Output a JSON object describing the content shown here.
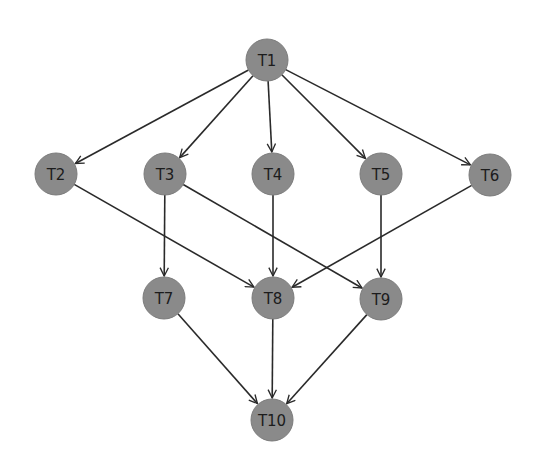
{
  "diagram": {
    "type": "directed-acyclic-graph",
    "node_color": "#8a8a8a",
    "edge_color": "#2a2a2a",
    "node_radius": 21,
    "nodes": [
      {
        "id": "T1",
        "label": "T1",
        "x": 267,
        "y": 60
      },
      {
        "id": "T2",
        "label": "T2",
        "x": 56,
        "y": 174
      },
      {
        "id": "T3",
        "label": "T3",
        "x": 165,
        "y": 174
      },
      {
        "id": "T4",
        "label": "T4",
        "x": 273,
        "y": 174
      },
      {
        "id": "T5",
        "label": "T5",
        "x": 381,
        "y": 174
      },
      {
        "id": "T6",
        "label": "T6",
        "x": 490,
        "y": 175
      },
      {
        "id": "T7",
        "label": "T7",
        "x": 164,
        "y": 298
      },
      {
        "id": "T8",
        "label": "T8",
        "x": 273,
        "y": 298
      },
      {
        "id": "T9",
        "label": "T9",
        "x": 381,
        "y": 299
      },
      {
        "id": "T10",
        "label": "T10",
        "x": 272,
        "y": 420
      }
    ],
    "edges": [
      {
        "from": "T1",
        "to": "T2"
      },
      {
        "from": "T1",
        "to": "T3"
      },
      {
        "from": "T1",
        "to": "T4"
      },
      {
        "from": "T1",
        "to": "T5"
      },
      {
        "from": "T1",
        "to": "T6"
      },
      {
        "from": "T2",
        "to": "T8"
      },
      {
        "from": "T3",
        "to": "T7"
      },
      {
        "from": "T3",
        "to": "T9"
      },
      {
        "from": "T4",
        "to": "T8"
      },
      {
        "from": "T5",
        "to": "T9"
      },
      {
        "from": "T6",
        "to": "T8"
      },
      {
        "from": "T7",
        "to": "T10"
      },
      {
        "from": "T8",
        "to": "T10"
      },
      {
        "from": "T9",
        "to": "T10"
      }
    ]
  }
}
